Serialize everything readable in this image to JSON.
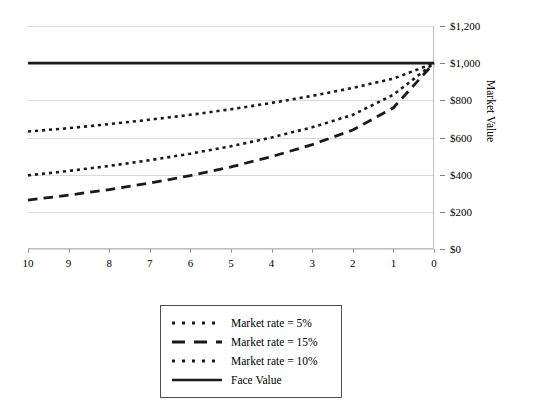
{
  "chart_data": {
    "type": "line",
    "title": "",
    "xlabel": "",
    "ylabel": "Market Value",
    "xlim": [
      10,
      0
    ],
    "ylim": [
      0,
      1200
    ],
    "x_reversed": true,
    "grid": true,
    "legend_position": "bottom-center",
    "x": [
      10,
      9,
      8,
      7,
      6,
      5,
      4,
      3,
      2,
      1,
      0
    ],
    "xticklabels": [
      "10",
      "9",
      "8",
      "7",
      "6",
      "5",
      "4",
      "3",
      "2",
      "1",
      "0"
    ],
    "yticks": [
      0,
      200,
      400,
      600,
      800,
      1000,
      1200
    ],
    "yticklabels": [
      "$0",
      "$200",
      "$400",
      "$600",
      "$800",
      "$1,000",
      "$1,200"
    ],
    "series": [
      {
        "name": "Market rate = 5%",
        "style": "dotted",
        "color": "#1a1a1a",
        "values": [
          632,
          650,
          672,
          696,
          722,
          752,
          786,
          824,
          867,
          917,
          1000
        ]
      },
      {
        "name": "Market rate = 15%",
        "style": "dashed",
        "color": "#1a1a1a",
        "values": [
          263,
          290,
          320,
          355,
          395,
          442,
          497,
          562,
          640,
          760,
          1000
        ]
      },
      {
        "name": "Market rate = 10%",
        "style": "dotted",
        "color": "#1a1a1a",
        "values": [
          396,
          420,
          447,
          478,
          513,
          553,
          600,
          655,
          722,
          830,
          1000
        ]
      },
      {
        "name": "Face Value",
        "style": "solid",
        "color": "#1a1a1a",
        "values": [
          1000,
          1000,
          1000,
          1000,
          1000,
          1000,
          1000,
          1000,
          1000,
          1000,
          1000
        ]
      }
    ]
  },
  "legend": {
    "entries": [
      {
        "label": "Market rate = 5%",
        "style": "dotted"
      },
      {
        "label": "Market rate = 15%",
        "style": "dashed"
      },
      {
        "label": "Market rate = 10%",
        "style": "dotted"
      },
      {
        "label": "Face Value",
        "style": "solid"
      }
    ]
  },
  "axes": {
    "y_title": "Market Value"
  }
}
